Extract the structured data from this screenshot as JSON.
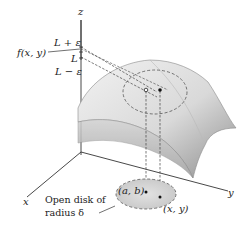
{
  "figure": {
    "axes": {
      "z_label": "z",
      "x_label": "x",
      "y_label": "y"
    },
    "z_ticks": {
      "upper": "L + ε",
      "middle": "L",
      "lower": "L − ε"
    },
    "function_label": "f(x, y)",
    "points": {
      "center": "(a, b)",
      "nearby": "(x, y)"
    },
    "disk_label_line1": "Open disk of",
    "disk_label_line2": "radius δ",
    "colors": {
      "surface_light": "#eeeeee",
      "surface_dark": "#9a9a9a",
      "disk_fill": "#d6d6d6",
      "axis": "#333333",
      "dashed": "#444444"
    }
  }
}
